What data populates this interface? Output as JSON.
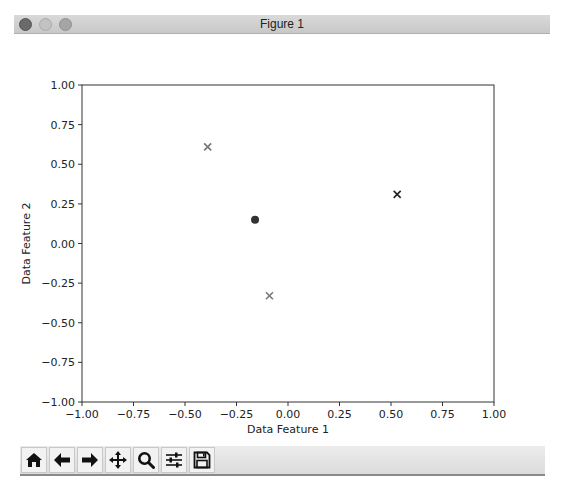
{
  "window": {
    "title": "Figure 1",
    "buttons": [
      "close",
      "minimize",
      "maximize"
    ]
  },
  "toolbar": {
    "items": [
      {
        "name": "home",
        "icon": "home-icon",
        "tooltip": "Reset original view"
      },
      {
        "name": "back",
        "icon": "arrow-left-icon",
        "tooltip": "Back to previous view"
      },
      {
        "name": "forward",
        "icon": "arrow-right-icon",
        "tooltip": "Forward to next view"
      },
      {
        "name": "pan",
        "icon": "move-icon",
        "tooltip": "Pan axes"
      },
      {
        "name": "zoom",
        "icon": "magnifier-icon",
        "tooltip": "Zoom to rectangle"
      },
      {
        "name": "subplots",
        "icon": "sliders-icon",
        "tooltip": "Configure subplots"
      },
      {
        "name": "save",
        "icon": "floppy-disk-icon",
        "tooltip": "Save the figure"
      }
    ]
  },
  "colors": {
    "axis": "#333333",
    "marker_gray": "#777777",
    "marker_dark": "#222222",
    "centroid": "#333333"
  },
  "chart_data": {
    "type": "scatter",
    "title": "",
    "xlabel": "Data Feature 1",
    "ylabel": "Data Feature 2",
    "xlim": [
      -1.0,
      1.0
    ],
    "ylim": [
      -1.0,
      1.0
    ],
    "xticks": [
      "-1.00",
      "-0.75",
      "-0.50",
      "-0.25",
      "0.00",
      "0.25",
      "0.50",
      "0.75",
      "1.00"
    ],
    "yticks": [
      "-1.00",
      "-0.75",
      "-0.50",
      "-0.25",
      "0.00",
      "0.25",
      "0.50",
      "0.75",
      "1.00"
    ],
    "grid": false,
    "legend": null,
    "series": [
      {
        "name": "points-gray",
        "marker": "x",
        "color": "#777777",
        "points": [
          {
            "x": -0.39,
            "y": 0.61
          },
          {
            "x": -0.09,
            "y": -0.33
          }
        ]
      },
      {
        "name": "points-dark",
        "marker": "x",
        "color": "#222222",
        "points": [
          {
            "x": 0.53,
            "y": 0.31
          }
        ]
      },
      {
        "name": "centroid",
        "marker": "o",
        "color": "#333333",
        "points": [
          {
            "x": -0.16,
            "y": 0.15
          }
        ]
      }
    ]
  }
}
